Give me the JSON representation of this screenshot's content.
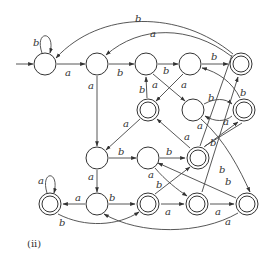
{
  "caption": "(ii)",
  "states": [
    {
      "id": "q0",
      "x": 45,
      "y": 64,
      "accepting": false,
      "initial": true
    },
    {
      "id": "q1",
      "x": 97,
      "y": 64,
      "accepting": false
    },
    {
      "id": "q2",
      "x": 146,
      "y": 64,
      "accepting": false
    },
    {
      "id": "q3",
      "x": 190,
      "y": 64,
      "accepting": false
    },
    {
      "id": "q4",
      "x": 241,
      "y": 64,
      "accepting": true
    },
    {
      "id": "q5",
      "x": 148,
      "y": 110,
      "accepting": true
    },
    {
      "id": "q6",
      "x": 193,
      "y": 110,
      "accepting": false
    },
    {
      "id": "q7",
      "x": 244,
      "y": 110,
      "accepting": true
    },
    {
      "id": "q8",
      "x": 97,
      "y": 158,
      "accepting": false
    },
    {
      "id": "q9",
      "x": 148,
      "y": 158,
      "accepting": false
    },
    {
      "id": "q10",
      "x": 198,
      "y": 158,
      "accepting": true
    },
    {
      "id": "q11",
      "x": 50,
      "y": 204,
      "accepting": true
    },
    {
      "id": "q12",
      "x": 97,
      "y": 204,
      "accepting": false
    },
    {
      "id": "q13",
      "x": 148,
      "y": 204,
      "accepting": true
    },
    {
      "id": "q14",
      "x": 197,
      "y": 204,
      "accepting": true
    },
    {
      "id": "q15",
      "x": 247,
      "y": 204,
      "accepting": true
    }
  ],
  "labels": {
    "q0_self": "b",
    "q0_q1": "a",
    "q1_q2": "b",
    "q1_q8": "a",
    "q2_q3": "b",
    "q2_q6": "a",
    "q3_q4": "b",
    "q3_q5": "a",
    "q4_q0": "b",
    "q4_q1": "a",
    "q5_q2": "b",
    "q5_q8": "a",
    "q6_q7": "b",
    "q7_q6": "a",
    "q7_q3": "b",
    "q6_q14": "a",
    "q8_q9": "b",
    "q8_q12": "a",
    "q9_q10": "b",
    "q9_q14": "a",
    "q10_q5": "a",
    "q10_q7": "b",
    "q11_self": "a",
    "q12_q11": "a",
    "q12_q13": "b",
    "q11_q13": "b",
    "q13_q10": "b",
    "q13_q14": "a",
    "q14_q15": "a",
    "q14_q4": "b",
    "q15_q9": "b",
    "q15_q12": "a",
    "q3_q15": "b"
  }
}
